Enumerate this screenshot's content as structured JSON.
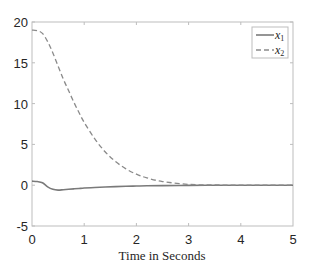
{
  "chart_data": {
    "type": "line",
    "title": "",
    "xlabel": "Time in Seconds",
    "ylabel": "",
    "xlim": [
      0,
      5
    ],
    "ylim": [
      -5,
      20
    ],
    "xticks": [
      "0",
      "1",
      "2",
      "3",
      "4",
      "5"
    ],
    "yticks": [
      "-5",
      "0",
      "5",
      "10",
      "15",
      "20"
    ],
    "grid": false,
    "legend_position": "upper right",
    "x": [
      0,
      0.1,
      0.2,
      0.3,
      0.4,
      0.5,
      0.6,
      0.7,
      0.8,
      0.9,
      1.0,
      1.2,
      1.4,
      1.6,
      1.8,
      2.0,
      2.2,
      2.5,
      3.0,
      3.5,
      4.0,
      4.5,
      5.0
    ],
    "series": [
      {
        "name": "x_1",
        "style": "solid",
        "color": "#7a7a7a",
        "values": [
          0.5,
          0.45,
          0.3,
          -0.2,
          -0.5,
          -0.6,
          -0.55,
          -0.5,
          -0.45,
          -0.4,
          -0.35,
          -0.28,
          -0.22,
          -0.17,
          -0.13,
          -0.1,
          -0.07,
          -0.05,
          -0.02,
          -0.01,
          0,
          0,
          0
        ]
      },
      {
        "name": "x_2",
        "style": "dashed",
        "color": "#7a7a7a",
        "values": [
          19,
          18.95,
          18.6,
          17.6,
          16.2,
          14.6,
          13.0,
          11.6,
          10.2,
          8.9,
          7.7,
          5.7,
          4.1,
          2.9,
          2.0,
          1.35,
          0.9,
          0.45,
          0.1,
          0.03,
          0.01,
          0,
          0
        ]
      }
    ]
  },
  "legend": {
    "items": [
      {
        "label": "x",
        "sub": "1",
        "style": "solid"
      },
      {
        "label": "x",
        "sub": "2",
        "style": "dashed"
      }
    ]
  },
  "axes": {
    "xlabel": "Time in Seconds",
    "xticks": [
      "0",
      "1",
      "2",
      "3",
      "4",
      "5"
    ],
    "yticks": [
      "20",
      "15",
      "10",
      "5",
      "0",
      "-5"
    ]
  }
}
